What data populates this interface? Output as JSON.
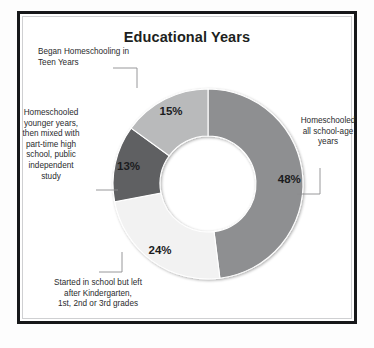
{
  "document": {
    "title": "Educational Years"
  },
  "chart_data": {
    "type": "pie",
    "variant": "donut",
    "title": "Educational Years",
    "xlabel": "",
    "ylabel": "",
    "legend_position": "callout-labels",
    "grid": false,
    "unit": "percent",
    "total": 100,
    "start_angle_deg": 0,
    "direction": "clockwise",
    "categories": [
      "Homeschooled all school-age years",
      "Started in school but left after Kindergarten, 1st, 2nd or 3rd grades",
      "Homeschooled younger years, then mixed with part-time high school, public independent study",
      "Began Homeschooling in Teen Years"
    ],
    "values": [
      48,
      24,
      13,
      15
    ],
    "value_labels": [
      "48%",
      "24%",
      "13%",
      "15%"
    ],
    "colors": [
      "#8e8f91",
      "#f2f2f2",
      "#5f6062",
      "#b9babb"
    ],
    "slices": [
      {
        "id": "all-school-age",
        "label": "Homeschooled all school-age years",
        "value": 48,
        "value_label": "48%",
        "color": "#8e8f91"
      },
      {
        "id": "started-in-school",
        "label": "Started in school but left after Kindergarten, 1st, 2nd or 3rd grades",
        "value": 24,
        "value_label": "24%",
        "color": "#f2f2f2"
      },
      {
        "id": "mixed-part-time",
        "label": "Homeschooled younger years, then mixed with part-time high school, public independent study",
        "value": 13,
        "value_label": "13%",
        "color": "#5f6062"
      },
      {
        "id": "teen-years",
        "label": "Began Homeschooling in Teen Years",
        "value": 15,
        "value_label": "15%",
        "color": "#b9babb"
      }
    ]
  },
  "callouts": {
    "teen_years": "Began Homeschooling in\nTeen Years",
    "mixed_part_time": "Homeschooled\nyounger years,\nthen mixed with\npart-time high\nschool, public\nindependent\nstudy",
    "all_school_age": "Homeschooled\nall school-age\nyears",
    "started_in_school": "Started in school but left\nafter Kindergarten,\n1st, 2nd or 3rd grades"
  }
}
